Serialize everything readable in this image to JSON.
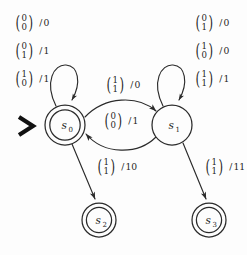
{
  "diagram": {
    "type": "mealy-state-machine",
    "title": "",
    "background_color": "#fdfdfd",
    "ink_color": "#2b2b2b",
    "start_marker": ">",
    "states": [
      {
        "id": "s0",
        "label": "s",
        "subscript": "0",
        "shape": "double-circle",
        "cx": 65,
        "cy": 125,
        "r": 20,
        "is_start": true,
        "is_accepting": true
      },
      {
        "id": "s1",
        "label": "s",
        "subscript": "1",
        "shape": "circle",
        "cx": 172,
        "cy": 125,
        "r": 20,
        "is_start": false,
        "is_accepting": false
      },
      {
        "id": "s2",
        "label": "s",
        "subscript": "2",
        "shape": "double-circle",
        "cx": 99,
        "cy": 220,
        "r": 17,
        "is_start": false,
        "is_accepting": true
      },
      {
        "id": "s3",
        "label": "s",
        "subscript": "3",
        "shape": "double-circle",
        "cx": 209,
        "cy": 220,
        "r": 17,
        "is_start": false,
        "is_accepting": true
      }
    ],
    "transitions": [
      {
        "id": "t1",
        "from": "s0",
        "to": "s0",
        "kind": "self-loop",
        "input_top": "0",
        "input_bottom": "0",
        "output": "0",
        "label_x": 10,
        "label_y": 14
      },
      {
        "id": "t2",
        "from": "s0",
        "to": "s0",
        "kind": "self-loop",
        "input_top": "0",
        "input_bottom": "1",
        "output": "1",
        "label_x": 10,
        "label_y": 42
      },
      {
        "id": "t3",
        "from": "s0",
        "to": "s0",
        "kind": "self-loop",
        "input_top": "1",
        "input_bottom": "0",
        "output": "1",
        "label_x": 10,
        "label_y": 70
      },
      {
        "id": "t4",
        "from": "s1",
        "to": "s1",
        "kind": "self-loop",
        "input_top": "0",
        "input_bottom": "1",
        "output": "0",
        "label_x": 190,
        "label_y": 14
      },
      {
        "id": "t5",
        "from": "s1",
        "to": "s1",
        "kind": "self-loop",
        "input_top": "1",
        "input_bottom": "0",
        "output": "0",
        "label_x": 190,
        "label_y": 42
      },
      {
        "id": "t6",
        "from": "s1",
        "to": "s1",
        "kind": "self-loop",
        "input_top": "1",
        "input_bottom": "1",
        "output": "1",
        "label_x": 190,
        "label_y": 70
      },
      {
        "id": "t7",
        "from": "s0",
        "to": "s1",
        "kind": "arc-top",
        "input_top": "1",
        "input_bottom": "1",
        "output": "0",
        "label_x": 101,
        "label_y": 76
      },
      {
        "id": "t8",
        "from": "s1",
        "to": "s0",
        "kind": "arc-bottom",
        "input_top": "0",
        "input_bottom": "0",
        "output": "1",
        "label_x": 99,
        "label_y": 112
      },
      {
        "id": "t9",
        "from": "s0",
        "to": "s2",
        "kind": "straight",
        "input_top": "1",
        "input_bottom": "1",
        "output": "10",
        "label_x": 92,
        "label_y": 158
      },
      {
        "id": "t10",
        "from": "s1",
        "to": "s3",
        "kind": "straight",
        "input_top": "1",
        "input_bottom": "1",
        "output": "11",
        "label_x": 200,
        "label_y": 158
      }
    ]
  }
}
